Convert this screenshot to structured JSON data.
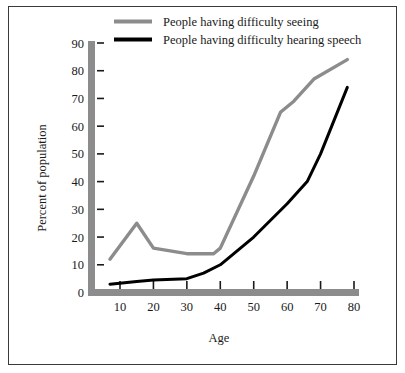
{
  "chart_data": {
    "type": "line",
    "title": "",
    "xlabel": "Age",
    "ylabel": "Percent of population",
    "xlim": [
      0,
      83
    ],
    "ylim": [
      0,
      90
    ],
    "xticks": [
      10,
      20,
      30,
      40,
      50,
      60,
      70,
      80
    ],
    "yticks": [
      0,
      10,
      20,
      30,
      40,
      50,
      60,
      70,
      80,
      90
    ],
    "xtick_labels": [
      "10",
      "20",
      "30",
      "40",
      "50",
      "60",
      "70",
      "80"
    ],
    "ytick_labels": [
      "0",
      "10",
      "20",
      "30",
      "40",
      "50",
      "60",
      "70",
      "80",
      "90"
    ],
    "grid": false,
    "legend_position": "top-center",
    "series": [
      {
        "name": "People having difficulty seeing",
        "color": "#8c8c8c",
        "x": [
          7,
          15,
          20,
          30,
          38,
          40,
          50,
          58,
          62,
          68,
          78
        ],
        "values": [
          12,
          25,
          16,
          14,
          14,
          16,
          42,
          65,
          69,
          77,
          84
        ]
      },
      {
        "name": "People having difficulty hearing speech",
        "color": "#000000",
        "x": [
          7,
          15,
          20,
          30,
          35,
          40,
          50,
          60,
          66,
          70,
          78
        ],
        "values": [
          3,
          4,
          4.5,
          5,
          7,
          10,
          20,
          32,
          40,
          50,
          74
        ]
      }
    ]
  },
  "legend": {
    "entries": [
      {
        "label": "People having difficulty seeing",
        "color": "#8c8c8c"
      },
      {
        "label": "People having difficulty hearing speech",
        "color": "#000000"
      }
    ]
  },
  "axes": {
    "x_title": "Age",
    "y_title": "Percent of population",
    "axis_color": "#8c8c8c"
  }
}
